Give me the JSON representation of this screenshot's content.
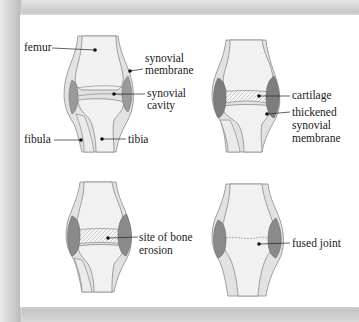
{
  "diagram": {
    "type": "anatomical illustration",
    "panels": [
      {
        "id": "healthy-joint",
        "labels": [
          {
            "text": "femur"
          },
          {
            "text": "synovial membrane",
            "lines": [
              "synovial",
              "membrane"
            ]
          },
          {
            "text": "synovial cavity",
            "lines": [
              "synovial",
              "cavity"
            ]
          },
          {
            "text": "fibula"
          },
          {
            "text": "tibia"
          }
        ]
      },
      {
        "id": "inflamed-joint",
        "labels": [
          {
            "text": "cartilage"
          },
          {
            "text": "thickened synovial membrane",
            "lines": [
              "thickened",
              "synovial",
              "membrane"
            ]
          }
        ]
      },
      {
        "id": "eroded-joint",
        "labels": [
          {
            "text": "site of bone erosion",
            "lines": [
              "site of bone",
              "erosion"
            ]
          }
        ]
      },
      {
        "id": "fused-joint",
        "labels": [
          {
            "text": "fused joint"
          }
        ]
      }
    ],
    "colors": {
      "bone": "#f1f1f1",
      "outline": "#8a8a8a",
      "membrane": "#9a9a9a",
      "membrane_thick": "#7d7d7d",
      "capsule": "#d6d6d6",
      "leader": "#222222",
      "panel_bg": "#ffffff",
      "frame": "#cfcfcf"
    }
  }
}
